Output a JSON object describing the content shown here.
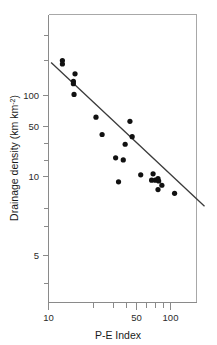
{
  "chart_data": {
    "type": "scatter",
    "title": "",
    "xlabel": "P-E Index",
    "ylabel": "Drainage density (km km",
    "ylabel_superscript": "-2",
    "ylabel_suffix": ")",
    "xscale": "log",
    "yscale": "log",
    "xlim": [
      10,
      200
    ],
    "ylim": [
      3,
      400
    ],
    "grid": false,
    "legend": null,
    "xticks_major": [
      10,
      50,
      100
    ],
    "xticklabels": [
      "10",
      "50",
      "100"
    ],
    "xticks_minor": [
      20,
      30,
      40,
      60,
      70,
      80,
      90,
      200
    ],
    "yticks_major": [
      100,
      50,
      10,
      5
    ],
    "yticklabels": [
      "100",
      "50",
      "10",
      "5"
    ],
    "yticks_minor": [
      300,
      200,
      20,
      30,
      3,
      4
    ],
    "marker": "filled-circle",
    "marker_color": "#111111",
    "points": [
      {
        "x": 13.0,
        "y": 270
      },
      {
        "x": 13.0,
        "y": 245
      },
      {
        "x": 16.5,
        "y": 185
      },
      {
        "x": 16.0,
        "y": 150
      },
      {
        "x": 16.0,
        "y": 140
      },
      {
        "x": 16.2,
        "y": 103
      },
      {
        "x": 24.5,
        "y": 54
      },
      {
        "x": 27.5,
        "y": 33
      },
      {
        "x": 35.5,
        "y": 17
      },
      {
        "x": 37.5,
        "y": 8.6
      },
      {
        "x": 41.0,
        "y": 16
      },
      {
        "x": 42.5,
        "y": 25
      },
      {
        "x": 46.5,
        "y": 48
      },
      {
        "x": 48.5,
        "y": 31
      },
      {
        "x": 57.0,
        "y": 10.5
      },
      {
        "x": 70.0,
        "y": 9.0
      },
      {
        "x": 72.0,
        "y": 10.8
      },
      {
        "x": 75.0,
        "y": 9.0
      },
      {
        "x": 79.0,
        "y": 9.4
      },
      {
        "x": 80.0,
        "y": 8.8
      },
      {
        "x": 79.0,
        "y": 6.9
      },
      {
        "x": 85.0,
        "y": 7.8
      },
      {
        "x": 108.0,
        "y": 6.2
      }
    ],
    "fit_line": {
      "type": "linear-on-log-log",
      "x_start": 10.5,
      "y_start": 255,
      "x_end": 190,
      "y_end": 4.3
    },
    "series_name": "Drainage density vs P-E Index"
  },
  "figure": {
    "background_color": "#ffffff",
    "axis_color": "#8a8a8a",
    "text_color": "#1a1a1a",
    "fit_line_color": "#3a3a3a"
  }
}
